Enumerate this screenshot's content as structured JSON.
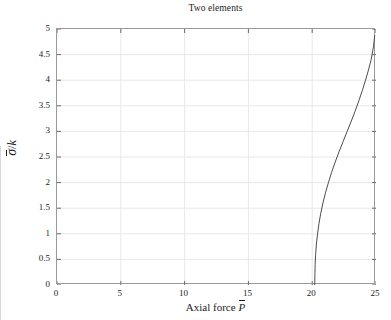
{
  "chart_data": {
    "type": "line",
    "title": "Two elements",
    "xlabel_text": "Axial force",
    "xlabel_symbol": "P",
    "ylabel_numerator": "σ",
    "ylabel_separator": "/",
    "ylabel_denominator": "k",
    "xlim": [
      0,
      25
    ],
    "ylim": [
      0,
      5
    ],
    "xticks": [
      0,
      5,
      10,
      15,
      20,
      25
    ],
    "xtick_labels": [
      "0",
      "5",
      "10",
      "15",
      "20",
      "25"
    ],
    "yticks": [
      0,
      0.5,
      1,
      1.5,
      2,
      2.5,
      3,
      3.5,
      4,
      4.5,
      5
    ],
    "ytick_labels": [
      "0",
      "0.5",
      "1",
      "1.5",
      "2",
      "2.5",
      "3",
      "3.5",
      "4",
      "4.5",
      "5"
    ],
    "grid": true,
    "grid_color": "#e8e8e8",
    "legend": null,
    "series": [
      {
        "name": "sigma-bar over k",
        "color": "#4d4d4d",
        "x": [
          20.2,
          20.21,
          20.23,
          20.27,
          20.33,
          20.42,
          20.53,
          20.67,
          20.84,
          21.04,
          21.27,
          21.52,
          21.8,
          22.1,
          22.42,
          22.74,
          23.06,
          23.37,
          23.66,
          23.93,
          24.18,
          24.41,
          24.62,
          24.8,
          24.9
        ],
        "y": [
          0.0,
          0.2,
          0.4,
          0.6,
          0.8,
          1.0,
          1.2,
          1.4,
          1.6,
          1.8,
          2.0,
          2.2,
          2.4,
          2.6,
          2.8,
          3.0,
          3.2,
          3.4,
          3.6,
          3.8,
          4.0,
          4.2,
          4.4,
          4.65,
          4.87
        ]
      }
    ]
  },
  "axes": {
    "line_color": "#9a9a9a",
    "tick_color": "#6a6a6a"
  }
}
